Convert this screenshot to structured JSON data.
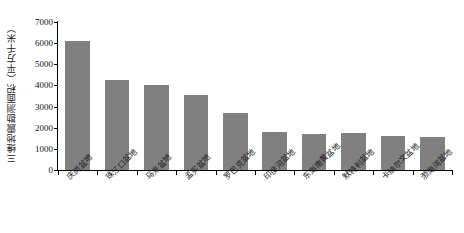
{
  "chart_data": {
    "type": "bar",
    "title": "",
    "xlabel": "",
    "ylabel": "三维地震勘测面积（平方千米）",
    "ylim": [
      0,
      7000
    ],
    "ytick_labels": [
      "0",
      "1000",
      "2000",
      "3000",
      "4000",
      "5000",
      "6000",
      "7000"
    ],
    "ytick_values": [
      0,
      1000,
      2000,
      3000,
      4000,
      5000,
      6000,
      7000
    ],
    "grid": false,
    "legend": null,
    "bar_color": "#808080",
    "axis_color": "#000000",
    "categories": [
      "庆岗盆地",
      "珠江口盆地",
      "马来盆地",
      "孟买盆地",
      "罗巴克盆地",
      "印度河盆地",
      "东海南黄盆地",
      "默特利盆地",
      "卡纳尔文盆地",
      "渤海湾盆地"
    ],
    "values": [
      6100,
      4250,
      4000,
      3550,
      2700,
      1780,
      1720,
      1730,
      1620,
      1540
    ]
  }
}
